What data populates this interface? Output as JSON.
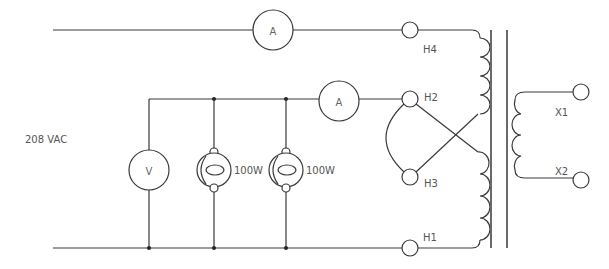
{
  "diagram": {
    "type": "transformer-test-circuit",
    "source": {
      "label": "208 VAC"
    },
    "meters": {
      "ammeter_top": {
        "label": "A"
      },
      "ammeter_mid": {
        "label": "A"
      },
      "voltmeter": {
        "label": "V"
      }
    },
    "loads": [
      {
        "label": "100W"
      },
      {
        "label": "100W"
      }
    ],
    "primary_terminals": {
      "h4": "H4",
      "h2": "H2",
      "h3": "H3",
      "h1": "H1"
    },
    "secondary_terminals": {
      "x1": "X1",
      "x2": "X2"
    },
    "colors": {
      "wire": "#3a3a3a",
      "core": "#6a6a6a",
      "label": "#555555",
      "background": "#ffffff"
    }
  }
}
